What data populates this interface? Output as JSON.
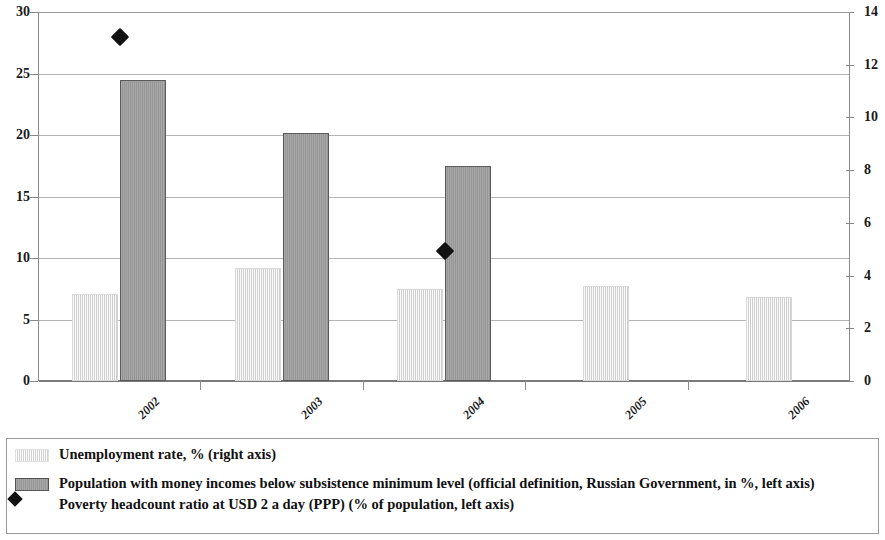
{
  "chart_data": {
    "type": "bar",
    "title": "",
    "xlabel": "",
    "categories": [
      "2002",
      "2003",
      "2004",
      "2005",
      "2006"
    ],
    "grid": true,
    "legend_position": "bottom",
    "axes": {
      "left": {
        "label": "",
        "ylim": [
          0,
          30
        ],
        "ticks": [
          0,
          5,
          10,
          15,
          20,
          25,
          30
        ],
        "tick_labels": [
          "0",
          "5",
          "10",
          "15",
          "20",
          "25",
          "30"
        ]
      },
      "right": {
        "label": "",
        "ylim": [
          0,
          14
        ],
        "ticks": [
          0,
          2,
          4,
          6,
          8,
          10,
          12,
          14
        ],
        "tick_labels": [
          "0",
          "2",
          "4",
          "6",
          "8",
          "10",
          "12",
          "14"
        ]
      }
    },
    "series": [
      {
        "name": "Unemployment rate, % (right axis)",
        "type": "bar",
        "axis": "right",
        "style": "light-hatched",
        "color": "#e3e3e3",
        "values": [
          3.3,
          4.3,
          3.5,
          3.6,
          3.2
        ]
      },
      {
        "name": "Population with money incomes below subsistence minimum level (official definition, Russian Government, in %, left axis)",
        "type": "bar",
        "axis": "left",
        "style": "solid-gray",
        "color": "#9d9d9d",
        "values": [
          24.5,
          20.2,
          17.5,
          null,
          null
        ]
      },
      {
        "name": "Poverty headcount ratio at USD 2 a day (PPP) (% of population, left axis)",
        "type": "marker",
        "axis": "left",
        "style": "diamond",
        "color": "#121212",
        "values": [
          28.0,
          null,
          10.6,
          null,
          null
        ]
      }
    ]
  },
  "legend": {
    "items": [
      {
        "swatch": "light-bar-swatch",
        "label": "Unemployment rate, % (right axis)"
      },
      {
        "swatch": "dark-bar-swatch",
        "label": "Population with money incomes below subsistence minimum level (official definition, Russian Government, in %, left axis)"
      },
      {
        "swatch": "diamond-marker-swatch",
        "label": "Poverty headcount ratio at USD 2 a day (PPP) (% of population, left axis)"
      }
    ]
  }
}
